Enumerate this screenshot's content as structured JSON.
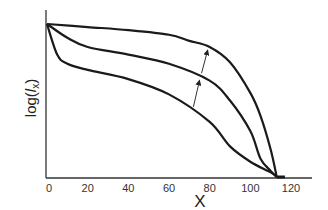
{
  "chart_data": {
    "type": "line",
    "title": "",
    "xlabel": "X",
    "ylabel": "log(l_x)",
    "ylabel_parts": {
      "prefix": "log(",
      "var": "l",
      "sub": "x",
      "suffix": ")"
    },
    "x_ticks": [
      "0",
      "20",
      "40",
      "60",
      "80",
      "100",
      "120"
    ],
    "xlim": [
      0,
      125
    ],
    "ylim": [
      0,
      1
    ],
    "y_ticks": [],
    "grid": false,
    "legend": null,
    "series": [
      {
        "name": "upper",
        "x": [
          0,
          20,
          40,
          60,
          70,
          80,
          90,
          100,
          105,
          110,
          113
        ],
        "y": [
          1.0,
          0.98,
          0.96,
          0.93,
          0.89,
          0.85,
          0.75,
          0.55,
          0.4,
          0.18,
          0.0
        ]
      },
      {
        "name": "middle",
        "x": [
          0,
          10,
          20,
          40,
          60,
          80,
          90,
          100,
          105,
          110,
          113
        ],
        "y": [
          1.0,
          0.91,
          0.85,
          0.8,
          0.74,
          0.63,
          0.5,
          0.3,
          0.12,
          0.04,
          0.0
        ]
      },
      {
        "name": "lower",
        "x": [
          0,
          5,
          10,
          20,
          40,
          60,
          80,
          90,
          100,
          110,
          113
        ],
        "y": [
          1.0,
          0.8,
          0.74,
          0.7,
          0.64,
          0.54,
          0.36,
          0.2,
          0.1,
          0.03,
          0.0
        ]
      }
    ],
    "annotations": [
      {
        "type": "arrow",
        "from_curve": "lower",
        "to_curve": "middle",
        "at_x": 72
      },
      {
        "type": "arrow",
        "from_curve": "middle",
        "to_curve": "upper",
        "at_x": 76
      }
    ]
  },
  "colors": {
    "line": "#1a1a1a",
    "axis": "#333333",
    "arrow": "#333333"
  }
}
